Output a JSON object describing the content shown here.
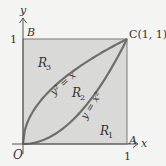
{
  "figure": {
    "axes": {
      "x_label": "x",
      "y_label": "y",
      "x_tick": "1",
      "y_tick": "1",
      "origin_label": "O"
    },
    "points": {
      "A": "A",
      "B": "B",
      "C": "C(1, 1)"
    },
    "curves": [
      {
        "name": "y2=x",
        "label": "y² = x"
      },
      {
        "name": "y=x2",
        "label": "y = x²"
      }
    ],
    "regions": [
      {
        "name": "R1",
        "label": "R",
        "sub": "1"
      },
      {
        "name": "R2",
        "label": "R",
        "sub": "2"
      },
      {
        "name": "R3",
        "label": "R",
        "sub": "3"
      }
    ],
    "colors": {
      "square_fill": "#d9d9d7",
      "lens_fill": "#cfcfcd",
      "curve": "#6e6e6e",
      "axis": "#555555",
      "background": "#f4f4f2"
    }
  }
}
